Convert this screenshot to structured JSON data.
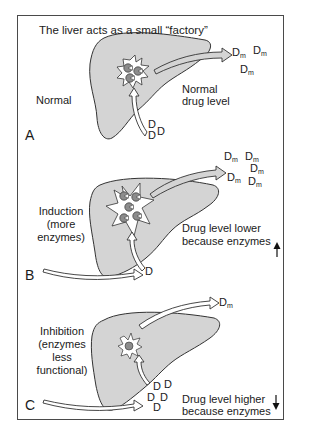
{
  "title": "The liver acts as a small “factory”",
  "colors": {
    "liver_fill": "#d4d4d4",
    "outline": "#333333",
    "enzyme_fill": "#8c8c8c",
    "border": "#4a4a4a"
  },
  "panels": [
    {
      "letter": "A",
      "condition": "Normal",
      "level_text_1": "Normal",
      "level_text_2": "drug level",
      "drug_symbol": "D",
      "metabolite_symbol": "D",
      "metabolite_sub": "m",
      "drug_count": 3,
      "metabolite_count": 3,
      "enzyme_count": 3
    },
    {
      "letter": "B",
      "condition_1": "Induction",
      "condition_2": "(more",
      "condition_3": "enzymes)",
      "level_text_1": "Drug level lower",
      "level_text_2": "because enzymes",
      "arrow": "up-arrow",
      "drug_symbol": "D",
      "metabolite_symbol": "D",
      "metabolite_sub": "m",
      "drug_count": 1,
      "metabolite_count": 5,
      "enzyme_count": 5
    },
    {
      "letter": "C",
      "condition_1": "Inhibition",
      "condition_2": "(enzymes",
      "condition_3": "less",
      "condition_4": "functional)",
      "level_text_1": "Drug level higher",
      "level_text_2": "because enzymes",
      "arrow": "down-arrow",
      "drug_symbol": "D",
      "metabolite_symbol": "D",
      "metabolite_sub": "m",
      "drug_count": 5,
      "metabolite_count": 1,
      "enzyme_count": 1
    }
  ]
}
